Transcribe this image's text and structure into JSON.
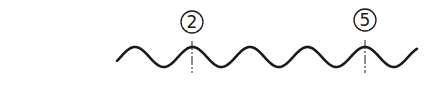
{
  "diagram": {
    "type": "wave-with-markers",
    "colors": {
      "stroke": "#1a1a1a",
      "background": "#ffffff"
    },
    "wave": {
      "start_x": 117,
      "end_x": 417,
      "center_y": 57,
      "amplitude": 10,
      "period": 57.5,
      "first_peak_x": 135
    },
    "markers": [
      {
        "id": "marker-2",
        "label": "2",
        "x": 192,
        "circle_cy": 22
      },
      {
        "id": "marker-5",
        "label": "5",
        "x": 365,
        "circle_cy": 20
      }
    ]
  }
}
